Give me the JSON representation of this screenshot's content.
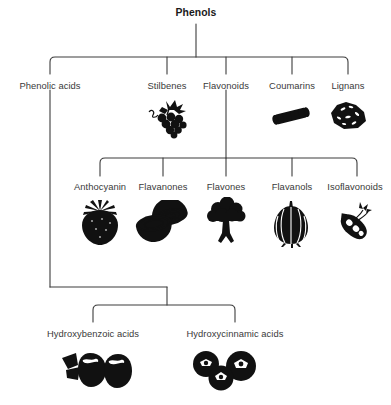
{
  "diagram": {
    "title": "Phenols",
    "type": "hierarchy-tree",
    "orientation": "top-down",
    "line_color": "#3c3c3c",
    "ink_color": "#111111",
    "background_color": "#ffffff",
    "root": {
      "label": "Phenols",
      "x": 196,
      "y": 13
    },
    "levels": [
      {
        "name": "phenol-classes",
        "bracket": {
          "x1": 50,
          "x2": 348,
          "y": 57,
          "stem_x": 196,
          "stem_top": 24,
          "drop_to": 74
        },
        "nodes": [
          {
            "id": "phenolic-acids",
            "label": "Phenolic acids",
            "x": 50,
            "label_y": 80,
            "icon": "none",
            "icon_name": "no-icon",
            "has_children": true
          },
          {
            "id": "stilbenes",
            "label": "Stilbenes",
            "x": 167,
            "label_y": 80,
            "icon": "grapes",
            "icon_name": "grapes-icon",
            "icon_x": 167,
            "icon_y": 98,
            "has_children": false
          },
          {
            "id": "flavonoids",
            "label": "Flavonoids",
            "x": 226,
            "label_y": 80,
            "icon": "none",
            "icon_name": "no-icon",
            "has_children": true
          },
          {
            "id": "coumarins",
            "label": "Coumarins",
            "x": 292,
            "label_y": 80,
            "icon": "cinnamon-stick",
            "icon_name": "cinnamon-stick-icon",
            "icon_x": 291,
            "icon_y": 104,
            "has_children": false
          },
          {
            "id": "lignans",
            "label": "Lignans",
            "x": 348,
            "label_y": 80,
            "icon": "flax-seeds",
            "icon_name": "flax-seeds-icon",
            "icon_x": 348,
            "icon_y": 100,
            "has_children": false
          }
        ]
      },
      {
        "name": "flavonoid-subclasses",
        "parent": "flavonoids",
        "bracket": {
          "x1": 100,
          "x2": 357,
          "y": 158,
          "stem_x": 226,
          "stem_top": 90,
          "drop_to": 176
        },
        "nodes": [
          {
            "id": "anthocyanin",
            "label": "Anthocyanin",
            "x": 100,
            "label_y": 181,
            "icon": "strawberry",
            "icon_name": "strawberry-icon",
            "icon_x": 100,
            "icon_y": 199
          },
          {
            "id": "flavanones",
            "label": "Flavanones",
            "x": 163,
            "label_y": 181,
            "icon": "citrus-halves",
            "icon_name": "citrus-halves-icon",
            "icon_x": 163,
            "icon_y": 200
          },
          {
            "id": "flavones",
            "label": "Flavones",
            "x": 226,
            "label_y": 181,
            "icon": "broccoli",
            "icon_name": "broccoli-icon",
            "icon_x": 226,
            "icon_y": 197
          },
          {
            "id": "flavanols",
            "label": "Flavanols",
            "x": 292,
            "label_y": 181,
            "icon": "onion",
            "icon_name": "onion-icon",
            "icon_x": 291,
            "icon_y": 200
          },
          {
            "id": "isoflavonoids",
            "label": "Isoflavonoids",
            "x": 355,
            "label_y": 181,
            "icon": "soybean-pod",
            "icon_name": "soybean-pod-icon",
            "icon_x": 353,
            "icon_y": 200
          }
        ]
      },
      {
        "name": "phenolic-acid-subclasses",
        "parent": "phenolic-acids",
        "bracket": {
          "x1": 93,
          "x2": 235,
          "y": 305,
          "stem_x": 167,
          "stem_top": 287,
          "drop_to": 322
        },
        "feed": {
          "from_x": 50,
          "from_y": 90,
          "down_to_y": 287,
          "across_to_x": 167
        },
        "nodes": [
          {
            "id": "hydroxybenzoic-acids",
            "label": "Hydroxybenzoic acids",
            "x": 93,
            "label_y": 328,
            "icon": "cranberries",
            "icon_name": "cranberries-icon",
            "icon_x": 97,
            "icon_y": 348
          },
          {
            "id": "hydroxycinnamic-acids",
            "label": "Hydroxycinnamic acids",
            "x": 235,
            "label_y": 328,
            "icon": "blueberries",
            "icon_name": "blueberries-icon",
            "icon_x": 223,
            "icon_y": 350
          }
        ]
      }
    ]
  }
}
